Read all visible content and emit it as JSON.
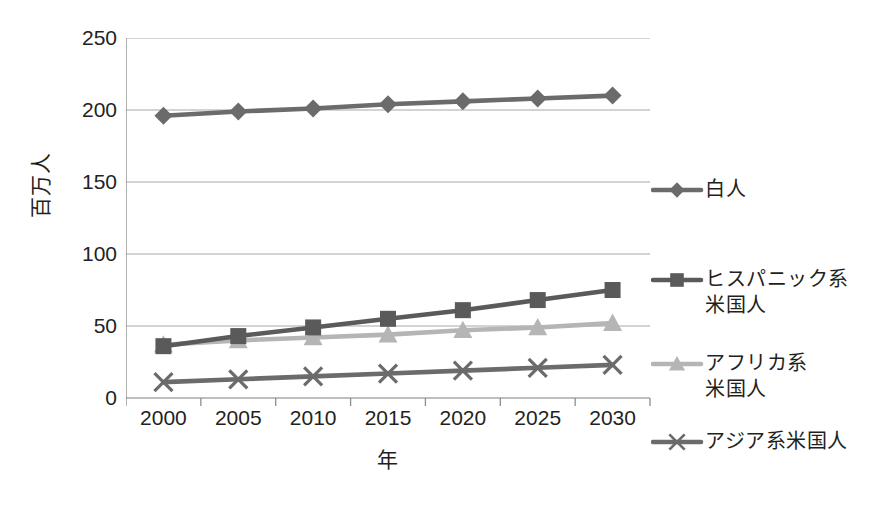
{
  "chart_data": {
    "type": "line",
    "title": "",
    "xlabel": "年",
    "ylabel": "百万人",
    "x": [
      2000,
      2005,
      2010,
      2015,
      2020,
      2025,
      2030
    ],
    "categories": [
      "2000",
      "2005",
      "2010",
      "2015",
      "2020",
      "2025",
      "2030"
    ],
    "ylim": [
      0,
      250
    ],
    "yticks": [
      0,
      50,
      100,
      150,
      200,
      250
    ],
    "ytick_labels": [
      "0",
      "50",
      "100",
      "150",
      "200",
      "250"
    ],
    "grid": true,
    "legend_position": "right",
    "series": [
      {
        "name": "白人",
        "marker": "diamond",
        "color": "#6b6b6b",
        "values": [
          196,
          199,
          201,
          204,
          206,
          208,
          210
        ]
      },
      {
        "name": "ヒスパニック系\n米国人",
        "marker": "square",
        "color": "#5a5a5a",
        "values": [
          36,
          43,
          49,
          55,
          61,
          68,
          75
        ]
      },
      {
        "name": "アフリカ系\n米国人",
        "marker": "triangle",
        "color": "#b5b5b5",
        "values": [
          37,
          40,
          42,
          44,
          47,
          49,
          52
        ]
      },
      {
        "name": "アジア系米国人",
        "marker": "x",
        "color": "#6b6b6b",
        "values": [
          11,
          13,
          15,
          17,
          19,
          21,
          23
        ]
      }
    ]
  },
  "axis": {
    "y_title": "百万人",
    "x_title": "年",
    "y_labels": [
      "250",
      "200",
      "150",
      "100",
      "50",
      "0"
    ],
    "x_labels": [
      "2000",
      "2005",
      "2010",
      "2015",
      "2020",
      "2025",
      "2030"
    ]
  },
  "legend": {
    "items": [
      {
        "label": "白人",
        "marker": "diamond-marker-icon",
        "color": "#6b6b6b"
      },
      {
        "label": "ヒスパニック系\n米国人",
        "marker": "square-marker-icon",
        "color": "#5a5a5a"
      },
      {
        "label": "アフリカ系\n米国人",
        "marker": "triangle-marker-icon",
        "color": "#b5b5b5"
      },
      {
        "label": "アジア系米国人",
        "marker": "x-marker-icon",
        "color": "#6b6b6b"
      }
    ]
  },
  "colors": {
    "grid": "#a8a8a8",
    "axis": "#8c8c8c",
    "text": "#231f20",
    "background": "#ffffff"
  }
}
